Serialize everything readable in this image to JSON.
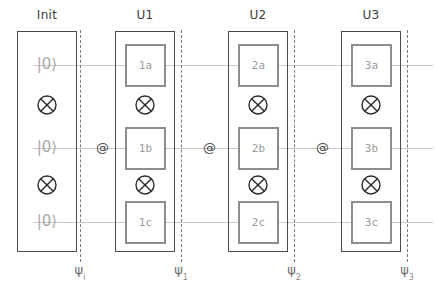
{
  "diagram": {
    "colors": {
      "stage_border": "#4a4a4a",
      "gate_border": "#8d8d8d",
      "gate_text": "#9a9a9a",
      "wire": "#c9c9c9",
      "barrier": "#7a7a7a",
      "header_text": "#3b3b3b",
      "ket_text": "#a8a8a8",
      "psi_text": "#6e6e6e",
      "background": "#ffffff"
    },
    "headers": [
      {
        "label": "Init",
        "x": 17,
        "width": 60
      },
      {
        "label": "U1",
        "x": 115,
        "width": 60
      },
      {
        "label": "U2",
        "x": 228,
        "width": 60
      },
      {
        "label": "U3",
        "x": 341,
        "width": 60
      }
    ],
    "stages": [
      {
        "name": "Init",
        "x": 17,
        "y": 31,
        "width": 60,
        "height": 221
      },
      {
        "name": "U1",
        "x": 115,
        "y": 31,
        "width": 60,
        "height": 221
      },
      {
        "name": "U2",
        "x": 228,
        "y": 31,
        "width": 60,
        "height": 221
      },
      {
        "name": "U3",
        "x": 341,
        "y": 31,
        "width": 60,
        "height": 221
      }
    ],
    "barriers": [
      {
        "name": "barrier-init",
        "x": 80,
        "y": 30,
        "height": 232
      },
      {
        "name": "barrier-u1",
        "x": 181,
        "y": 30,
        "height": 232
      },
      {
        "name": "barrier-u2",
        "x": 294,
        "y": 30,
        "height": 232
      },
      {
        "name": "barrier-u3",
        "x": 407,
        "y": 30,
        "height": 232
      }
    ],
    "wires": [
      {
        "name": "wire-qubit-a",
        "y": 65,
        "x": 33,
        "width": 400
      },
      {
        "name": "wire-qubit-b",
        "y": 148,
        "x": 33,
        "width": 400
      },
      {
        "name": "wire-qubit-c",
        "y": 222,
        "x": 33,
        "width": 400
      }
    ],
    "kets": [
      {
        "label": "|0⟩",
        "x": 17,
        "y": 56,
        "width": 60
      },
      {
        "label": "|0⟩",
        "x": 17,
        "y": 139,
        "width": 60
      },
      {
        "label": "|0⟩",
        "x": 17,
        "y": 213,
        "width": 60
      }
    ],
    "tensors": [
      {
        "name": "tensor-init-top",
        "cx": 47,
        "cy": 105
      },
      {
        "name": "tensor-init-bottom",
        "cx": 47,
        "cy": 185
      },
      {
        "name": "tensor-u1-top",
        "cx": 145,
        "cy": 105
      },
      {
        "name": "tensor-u1-bottom",
        "cx": 145,
        "cy": 185
      },
      {
        "name": "tensor-u2-top",
        "cx": 258,
        "cy": 105
      },
      {
        "name": "tensor-u2-bottom",
        "cx": 258,
        "cy": 185
      },
      {
        "name": "tensor-u3-top",
        "cx": 371,
        "cy": 105
      },
      {
        "name": "tensor-u3-bottom",
        "cx": 371,
        "cy": 185
      }
    ],
    "gates": [
      {
        "label": "1a",
        "x": 125,
        "y": 44,
        "width": 41,
        "height": 43
      },
      {
        "label": "1b",
        "x": 125,
        "y": 127,
        "width": 41,
        "height": 43
      },
      {
        "label": "1c",
        "x": 125,
        "y": 201,
        "width": 41,
        "height": 43
      },
      {
        "label": "2a",
        "x": 238,
        "y": 44,
        "width": 41,
        "height": 43
      },
      {
        "label": "2b",
        "x": 238,
        "y": 127,
        "width": 41,
        "height": 43
      },
      {
        "label": "2c",
        "x": 238,
        "y": 201,
        "width": 41,
        "height": 43
      },
      {
        "label": "3a",
        "x": 351,
        "y": 44,
        "width": 41,
        "height": 43
      },
      {
        "label": "3b",
        "x": 351,
        "y": 127,
        "width": 41,
        "height": 43
      },
      {
        "label": "3c",
        "x": 351,
        "y": 201,
        "width": 41,
        "height": 43
      }
    ],
    "connectors": [
      {
        "label": "@",
        "name": "at-connector-1",
        "x": 96,
        "y": 141
      },
      {
        "label": "@",
        "name": "at-connector-2",
        "x": 203,
        "y": 141
      },
      {
        "label": "@",
        "name": "at-connector-3",
        "x": 316,
        "y": 141
      }
    ],
    "states": [
      {
        "symbol": "ψ",
        "subscript": "i",
        "x": 80,
        "y": 262
      },
      {
        "symbol": "ψ",
        "subscript": "1",
        "x": 181,
        "y": 262
      },
      {
        "symbol": "ψ",
        "subscript": "2",
        "x": 294,
        "y": 262
      },
      {
        "symbol": "ψ",
        "subscript": "3",
        "x": 407,
        "y": 262
      }
    ]
  }
}
